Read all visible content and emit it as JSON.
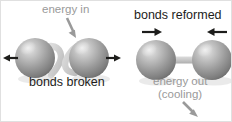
{
  "diagram": {
    "canvas": {
      "width": 232,
      "height": 122,
      "background": "#ffffff",
      "border_color": "#e0e0e0"
    },
    "colors": {
      "text_dark": "#1d1d1b",
      "text_gray": "#9a9a9a",
      "arrow_dark": "#1d1d1b",
      "arrow_gray": "#9a9a9a",
      "sphere_light": "#d9d9d9",
      "sphere_mid": "#9d9d9d",
      "sphere_dark": "#6e6e6e",
      "sphere_highlight": "#e8e8e8",
      "bond_gray": "#c3c3c3",
      "broken_bond_gray": "#c9c9c9"
    },
    "labels": {
      "energy_in": "energy in",
      "bonds_broken": "bonds broken",
      "bonds_reformed": "bonds reformed",
      "energy_out": "energy out",
      "cooling": "(cooling)"
    },
    "left_panel": {
      "name": "bonds-broken-group",
      "caption": "bonds broken",
      "energy_label": "energy in",
      "atoms": [
        {
          "name": "atom-left-1",
          "cx": 34,
          "cy": 57,
          "r": 20
        },
        {
          "name": "atom-left-2",
          "cx": 88,
          "cy": 57,
          "r": 20
        }
      ],
      "arrows": [
        {
          "name": "arrow-atom-left-outward",
          "direction": "left",
          "color": "#1d1d1b"
        },
        {
          "name": "arrow-atom-right-outward",
          "direction": "right",
          "color": "#1d1d1b"
        }
      ],
      "energy_arrow": {
        "name": "energy-in-arrow",
        "direction": "down-right",
        "color": "#9a9a9a"
      },
      "broken_bond_segments": 2
    },
    "right_panel": {
      "name": "bonds-reformed-group",
      "caption": "bonds reformed",
      "energy_label": "energy out",
      "energy_sublabel": "(cooling)",
      "atoms": [
        {
          "name": "atom-right-1",
          "cx": 155,
          "cy": 59,
          "r": 20
        },
        {
          "name": "atom-right-2",
          "cx": 211,
          "cy": 59,
          "r": 20
        }
      ],
      "bond": {
        "name": "reformed-bond",
        "x1": 172,
        "x2": 196,
        "y": 59,
        "thickness": 7
      },
      "arrows": [
        {
          "name": "arrow-atom-left-inward",
          "direction": "right",
          "color": "#1d1d1b"
        },
        {
          "name": "arrow-atom-right-inward",
          "direction": "left",
          "color": "#1d1d1b"
        }
      ],
      "energy_arrow": {
        "name": "energy-out-arrow",
        "direction": "down-right",
        "color": "#9a9a9a"
      }
    }
  }
}
